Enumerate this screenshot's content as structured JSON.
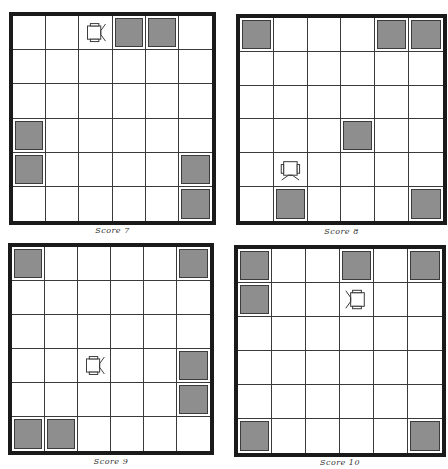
{
  "figure": {
    "grid_size": 6,
    "colors": {
      "border": "#1a1a1a",
      "grid_line": "#3a3a3a",
      "obstacle_fill": "#8e8e8e",
      "obstacle_edge": "#3c3c3c",
      "background": "#ffffff"
    },
    "panels": [
      {
        "caption": "Score 7",
        "score": 7,
        "robot": {
          "row": 0,
          "col": 2,
          "facing": "right"
        },
        "obstacles": [
          [
            0,
            3
          ],
          [
            0,
            4
          ],
          [
            3,
            0
          ],
          [
            4,
            0
          ],
          [
            4,
            5
          ],
          [
            5,
            5
          ]
        ]
      },
      {
        "caption": "Score 8",
        "score": 8,
        "robot": {
          "row": 4,
          "col": 1,
          "facing": "down"
        },
        "obstacles": [
          [
            0,
            0
          ],
          [
            0,
            4
          ],
          [
            0,
            5
          ],
          [
            3,
            3
          ],
          [
            5,
            1
          ],
          [
            5,
            5
          ]
        ]
      },
      {
        "caption": "Score 9",
        "score": 9,
        "robot": {
          "row": 3,
          "col": 2,
          "facing": "right"
        },
        "obstacles": [
          [
            0,
            0
          ],
          [
            0,
            5
          ],
          [
            3,
            5
          ],
          [
            4,
            5
          ],
          [
            5,
            0
          ],
          [
            5,
            1
          ]
        ]
      },
      {
        "caption": "Score 10",
        "score": 10,
        "robot": {
          "row": 1,
          "col": 3,
          "facing": "left"
        },
        "obstacles": [
          [
            0,
            0
          ],
          [
            0,
            3
          ],
          [
            0,
            5
          ],
          [
            1,
            0
          ],
          [
            5,
            0
          ],
          [
            5,
            5
          ]
        ]
      }
    ]
  }
}
